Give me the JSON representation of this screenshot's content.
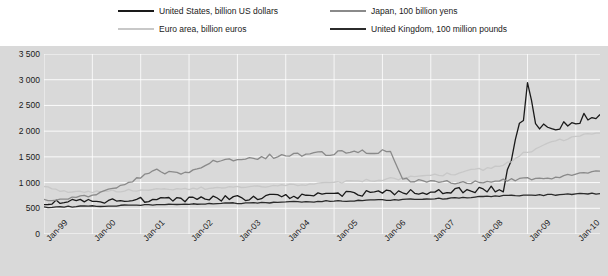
{
  "legend": {
    "items": [
      {
        "label": "United States, billion US dollars",
        "color": "#1a1a1a"
      },
      {
        "label": "Euro area, billion euros",
        "color": "#c8c8c8"
      },
      {
        "label": "Japan, 100 billion yens",
        "color": "#8a8a8a"
      },
      {
        "label": "United Kingdom, 100 million pounds",
        "color": "#2b2b2b"
      }
    ]
  },
  "chart_data": {
    "type": "line",
    "title": "",
    "xlabel": "",
    "ylabel": "",
    "grid": true,
    "legend_position": "top",
    "plot_background": "#d9d9d9",
    "ylim": [
      0,
      3500
    ],
    "yticks": [
      0,
      500,
      1000,
      1500,
      2000,
      2500,
      3000,
      3500
    ],
    "ytick_labels": [
      "0",
      "500",
      "1 000",
      "1 500",
      "2 000",
      "2 500",
      "3 000",
      "3 500"
    ],
    "xticks": [
      "Jan-99",
      "Jan-00",
      "Jan-01",
      "Jan-02",
      "Jan-03",
      "Jan-04",
      "Jan-05",
      "Jan-06",
      "Jan-07",
      "Jan-08",
      "Jan-09",
      "Jan-10"
    ],
    "x_start": "Jan-99",
    "x_end": "Jan-10",
    "series": [
      {
        "name": "United States, billion US dollars",
        "color": "#1a1a1a",
        "unit": "billion US dollars",
        "x": [
          "Jan-99",
          "Jul-99",
          "Jan-00",
          "Jul-00",
          "Jan-01",
          "Jul-01",
          "Jan-02",
          "Jul-02",
          "Jan-03",
          "Jul-03",
          "Jan-04",
          "Jul-04",
          "Jan-05",
          "Jul-05",
          "Jan-06",
          "Jul-06",
          "Jan-07",
          "Jul-07",
          "Jan-08",
          "Jul-08",
          "Sep-08",
          "Nov-08",
          "Dec-08",
          "Jan-09",
          "Mar-09",
          "May-09",
          "Jul-09",
          "Sep-09",
          "Nov-09",
          "Jan-10",
          "Jul-10"
        ],
        "values": [
          620,
          630,
          640,
          650,
          660,
          670,
          680,
          690,
          700,
          710,
          730,
          740,
          760,
          780,
          800,
          810,
          830,
          850,
          860,
          880,
          1500,
          2200,
          2250,
          2900,
          2050,
          2100,
          2100,
          2150,
          2200,
          2200,
          2300
        ]
      },
      {
        "name": "Euro area, billion euros",
        "color": "#c8c8c8",
        "unit": "billion euros",
        "x": [
          "Jan-99",
          "Jul-99",
          "Jan-00",
          "Jul-00",
          "Jan-01",
          "Jul-01",
          "Jan-02",
          "Jul-02",
          "Jan-03",
          "Jul-03",
          "Jan-04",
          "Jul-04",
          "Jan-05",
          "Jul-05",
          "Jan-06",
          "Jul-06",
          "Jan-07",
          "Jul-07",
          "Jan-08",
          "Jul-08",
          "Jan-09",
          "Jul-09",
          "Jan-10",
          "Jul-10"
        ],
        "values": [
          930,
          800,
          820,
          840,
          850,
          870,
          880,
          900,
          910,
          930,
          950,
          970,
          1000,
          1030,
          1060,
          1090,
          1130,
          1180,
          1250,
          1350,
          1600,
          1800,
          1900,
          2000
        ]
      },
      {
        "name": "Japan, 100 billion yens",
        "color": "#8a8a8a",
        "unit": "100 billion yens",
        "x": [
          "Jan-99",
          "Jul-99",
          "Jan-00",
          "Jul-00",
          "Jan-01",
          "Apr-01",
          "Jul-01",
          "Jan-02",
          "Jul-02",
          "Jan-03",
          "Jul-03",
          "Jan-04",
          "Jul-04",
          "Jan-05",
          "Jul-05",
          "Jan-06",
          "Mar-06",
          "Jun-06",
          "Jul-06",
          "Jan-07",
          "Jul-07",
          "Jan-08",
          "Jul-08",
          "Jan-09",
          "Jul-09",
          "Jan-10",
          "Jul-10"
        ],
        "values": [
          660,
          700,
          740,
          900,
          1100,
          1250,
          1180,
          1200,
          1400,
          1450,
          1500,
          1520,
          1550,
          1570,
          1600,
          1600,
          1580,
          1100,
          1050,
          1020,
          1000,
          1020,
          1050,
          1080,
          1100,
          1150,
          1200
        ]
      },
      {
        "name": "United Kingdom, 100 million pounds",
        "color": "#2b2b2b",
        "unit": "100 million pounds",
        "x": [
          "Jan-99",
          "Jul-99",
          "Jan-00",
          "Jul-00",
          "Jan-01",
          "Jul-01",
          "Jan-02",
          "Jul-02",
          "Jan-03",
          "Jul-03",
          "Jan-04",
          "Jul-04",
          "Jan-05",
          "Jul-05",
          "Jan-06",
          "Jul-06",
          "Jan-07",
          "Jul-07",
          "Jan-08",
          "Jul-08",
          "Jan-09",
          "Jul-09",
          "Jan-10",
          "Jul-10"
        ],
        "values": [
          520,
          530,
          540,
          550,
          560,
          570,
          580,
          590,
          600,
          610,
          620,
          630,
          640,
          650,
          660,
          670,
          680,
          700,
          720,
          740,
          750,
          760,
          780,
          790
        ]
      }
    ]
  }
}
